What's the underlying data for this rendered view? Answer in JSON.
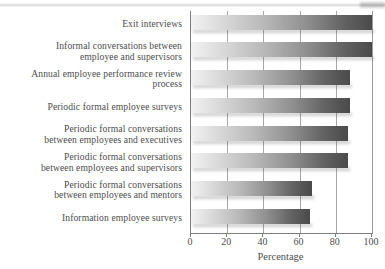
{
  "chart_data": {
    "type": "bar",
    "orientation": "horizontal",
    "title": "",
    "xlabel": "Percentage",
    "ylabel": "",
    "xlim": [
      0,
      100
    ],
    "xticks": [
      0,
      20,
      40,
      60,
      80,
      100
    ],
    "grid": true,
    "legend": false,
    "categories": [
      "Exit interviews",
      "Informal conversations between employee and supervisors",
      "Annual employee performance review process",
      "Periodic formal employee surveys",
      "Periodic formal conversations between employees and executives",
      "Periodic formal conversations between employees and supervisors",
      "Periodic formal conversations between employees and mentors",
      "Information employee surveys"
    ],
    "category_lines": [
      [
        "Exit interviews",
        ""
      ],
      [
        "Informal conversations between",
        "employee and supervisors"
      ],
      [
        "Annual employee performance review",
        "process"
      ],
      [
        "Periodic formal employee surveys",
        ""
      ],
      [
        "Periodic formal conversations",
        "between employees and executives"
      ],
      [
        "Periodic formal conversations",
        "between employees and supervisors"
      ],
      [
        "Periodic formal conversations",
        "between employees and mentors"
      ],
      [
        "Information employee surveys",
        ""
      ]
    ],
    "values": [
      100,
      100,
      88,
      88,
      87,
      87,
      67,
      66
    ]
  },
  "axis": {
    "tick_labels": [
      "0",
      "20",
      "40",
      "60",
      "80",
      "100"
    ],
    "x_title": "Percentage"
  },
  "colors": {
    "bar_gradient_start": "#f2f2f2",
    "bar_gradient_end": "#4a4a4a",
    "gridline": "#a8a8a8",
    "axis": "#7d7d7d",
    "text": "#4d4d4d",
    "background": "#ffffff"
  }
}
